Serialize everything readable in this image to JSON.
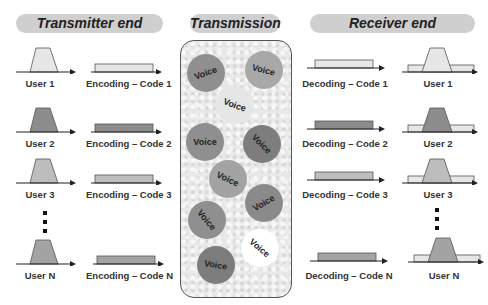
{
  "headers": {
    "transmitter": "Transmitter end",
    "transmission": "Transmission",
    "receiver": "Receiver end"
  },
  "colors": {
    "user1": "#e6e6e6",
    "user2": "#8c8c8c",
    "user3": "#bdbdbd",
    "userN": "#a3a3a3",
    "header_bg": "#cfcfcf",
    "panel_border": "#555555"
  },
  "transmitter": {
    "users": [
      {
        "label": "User 1",
        "code": "Encoding – Code 1"
      },
      {
        "label": "User 2",
        "code": "Encoding – Code 2"
      },
      {
        "label": "User 3",
        "code": "Encoding – Code 3"
      },
      {
        "label": "User N",
        "code": "Encoding – Code N"
      }
    ]
  },
  "receiver": {
    "users": [
      {
        "label": "User 1",
        "code": "Decoding – Code 1"
      },
      {
        "label": "User 2",
        "code": "Decoding – Code 2"
      },
      {
        "label": "User 3",
        "code": "Decoding – Code 3"
      },
      {
        "label": "User N",
        "code": "Decoding – Code N"
      }
    ]
  },
  "transmission": {
    "packets": [
      {
        "label": "Voice",
        "shade": "#8f8f8f",
        "rot": -20
      },
      {
        "label": "Voice",
        "shade": "#a8a8a8",
        "rot": 15
      },
      {
        "label": "Voice",
        "shade": "#e6e6e6",
        "rot": 20
      },
      {
        "label": "Voice",
        "shade": "#8f8f8f",
        "rot": 0
      },
      {
        "label": "Voice",
        "shade": "#7d7d7d",
        "rot": 45
      },
      {
        "label": "Voice",
        "shade": "#a3a3a3",
        "rot": 25
      },
      {
        "label": "Voice",
        "shade": "#8a8a8a",
        "rot": -30
      },
      {
        "label": "Voice",
        "shade": "#8f8f8f",
        "rot": 50
      },
      {
        "label": "Voice",
        "shade": "#ffffff",
        "rot": 40
      },
      {
        "label": "Voice",
        "shade": "#7d7d7d",
        "rot": 10
      }
    ]
  }
}
